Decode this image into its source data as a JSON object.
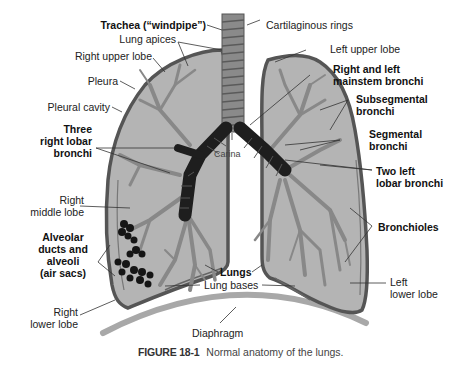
{
  "figure": {
    "number": "FIGURE 18-1",
    "caption": "Normal anatomy of the lungs."
  },
  "colors": {
    "lung_fill": "#b4b4b4",
    "pleura_outline": "#555555",
    "bronchi_dark": "#1e1e1e",
    "trachea": "#8a8a8a",
    "diaphragm": "#a8a8a8",
    "alveoli": "#151515"
  },
  "labels": {
    "trachea": "Trachea (“windpipe”)",
    "cartilaginous_rings": "Cartilaginous rings",
    "lung_apices": "Lung apices",
    "right_upper_lobe": "Right upper lobe",
    "left_upper_lobe": "Left upper lobe",
    "pleura": "Pleura",
    "mainstem_line1": "Right and left",
    "mainstem_line2": "mainstem bronchi",
    "pleural_cavity": "Pleural cavity",
    "subsegmental_line1": "Subsegmental",
    "subsegmental_line2": "bronchi",
    "three_lobar_line1": "Three",
    "three_lobar_line2": "right lobar",
    "three_lobar_line3": "bronchi",
    "segmental_line1": "Segmental",
    "segmental_line2": "bronchi",
    "carina": "Carina",
    "two_left_line1": "Two left",
    "two_left_line2": "lobar bronchi",
    "right_middle_line1": "Right",
    "right_middle_line2": "middle lobe",
    "alveolar_line1": "Alveolar",
    "alveolar_line2": "ducts and",
    "alveolar_line3": "alveoli",
    "alveolar_line4": "(air sacs)",
    "bronchioles": "Bronchioles",
    "lungs": "Lungs",
    "lung_bases": "Lung bases",
    "left_lower_line1": "Left",
    "left_lower_line2": "lower lobe",
    "right_lower_line1": "Right",
    "right_lower_line2": "lower lobe",
    "diaphragm": "Diaphragm"
  }
}
